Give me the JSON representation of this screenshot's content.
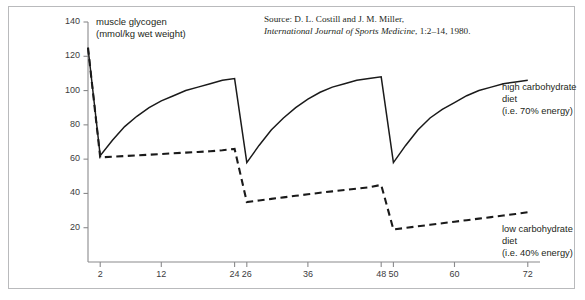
{
  "figure": {
    "source_prefix": "Source: D. L. Costill and J. M. Miller,",
    "source_journal": "International Journal of Sports Medicine",
    "source_cite": ", 1:2–14, 1980.",
    "y_axis_title_line1": "muscle glycogen",
    "y_axis_title_line2": "(mmol/kg wet weight)",
    "legend_high_line1": "high carbohydrate",
    "legend_high_line2": "diet",
    "legend_high_line3": "(i.e. 70% energy)",
    "legend_low_line1": "low carbohydrate",
    "legend_low_line2": "diet",
    "legend_low_line3": "(i.e. 40% energy)",
    "border_color": "#b9babc",
    "axis_color": "#8a8a8c",
    "line_color": "#1a1a1a"
  },
  "chart_data": {
    "type": "line",
    "title": "",
    "xlabel": "",
    "ylabel": "muscle glycogen (mmol/kg wet weight)",
    "xlim": [
      0,
      74
    ],
    "ylim": [
      0,
      140
    ],
    "xticks": [
      2,
      12,
      24,
      26,
      36,
      48,
      50,
      60,
      72
    ],
    "xtick_labels": [
      "2",
      "12",
      "24",
      "26",
      "36",
      "48",
      "50",
      "60",
      "72"
    ],
    "yticks": [
      20,
      40,
      60,
      80,
      100,
      120,
      140
    ],
    "ytick_labels": [
      "20",
      "40",
      "60",
      "80",
      "100",
      "120",
      "140"
    ],
    "grid": false,
    "legend_position": "right",
    "series": [
      {
        "name": "high carbohydrate diet (i.e. 70% energy)",
        "style": "solid",
        "color": "#1a1a1a",
        "x": [
          0,
          2,
          4,
          6,
          8,
          10,
          12,
          14,
          16,
          18,
          20,
          22,
          24,
          26,
          28,
          30,
          32,
          34,
          36,
          38,
          40,
          42,
          44,
          46,
          48,
          50,
          52,
          54,
          56,
          58,
          60,
          62,
          64,
          66,
          68,
          70,
          72
        ],
        "y": [
          125,
          62,
          71,
          79,
          85,
          90,
          94,
          97,
          100,
          102,
          104,
          106,
          107,
          58,
          68,
          77,
          84,
          90,
          95,
          99,
          102,
          104,
          106,
          107,
          108,
          58,
          68,
          77,
          84,
          89,
          93,
          97,
          100,
          102,
          104,
          105,
          106
        ]
      },
      {
        "name": "low carbohydrate diet (i.e. 40% energy)",
        "style": "dashed",
        "color": "#1a1a1a",
        "x": [
          0,
          2,
          4,
          6,
          8,
          10,
          12,
          14,
          16,
          18,
          20,
          22,
          24,
          26,
          28,
          30,
          32,
          34,
          36,
          38,
          40,
          42,
          44,
          46,
          48,
          50,
          52,
          54,
          56,
          58,
          60,
          62,
          64,
          66,
          68,
          70,
          72
        ],
        "y": [
          125,
          61,
          61.4,
          61.8,
          62.2,
          62.6,
          63,
          63.4,
          63.8,
          64.2,
          64.6,
          65.2,
          66,
          35,
          35.9,
          36.8,
          37.7,
          38.6,
          39.5,
          40.4,
          41.2,
          42,
          42.8,
          43.6,
          45,
          19,
          19.9,
          20.8,
          21.7,
          22.6,
          23.5,
          24.4,
          25.3,
          26.2,
          27.1,
          28,
          29
        ]
      }
    ],
    "annotations": [
      {
        "text": "muscle glycogen (mmol/kg wet weight)",
        "role": "axis-title"
      },
      {
        "text": "Source: D. L. Costill and J. M. Miller, International Journal of Sports Medicine, 1:2–14, 1980.",
        "role": "source"
      }
    ]
  }
}
